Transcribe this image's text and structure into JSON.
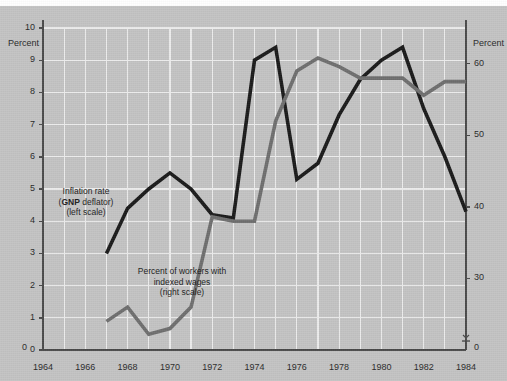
{
  "figure": {
    "background_color": "#c3c3c3",
    "plot_area": {
      "left": 43,
      "right": 466,
      "top": 28,
      "bottom": 350
    },
    "left_axis_title": "Percent",
    "right_axis_title": "Percent"
  },
  "annotations": [
    {
      "name": "inflation-label",
      "lines": [
        "Inflation rate",
        "(GNP deflator)",
        "(left scale)"
      ],
      "bold_word": "GNP",
      "x": 86,
      "y": 186
    },
    {
      "name": "indexed-wages-label",
      "lines": [
        "Percent of workers with",
        "indexed wages",
        "(right scale)"
      ],
      "x": 182,
      "y": 266
    }
  ],
  "chart_data": {
    "type": "line",
    "title": "",
    "xlabel": "",
    "ylabel": "Percent",
    "grid": true,
    "legend_position": "inline-annotations",
    "x": [
      1964,
      1965,
      1966,
      1967,
      1968,
      1969,
      1970,
      1971,
      1972,
      1973,
      1974,
      1975,
      1976,
      1977,
      1978,
      1979,
      1980,
      1981,
      1982,
      1983,
      1984
    ],
    "x_ticks": [
      1964,
      1966,
      1968,
      1970,
      1972,
      1974,
      1976,
      1978,
      1980,
      1982,
      1984
    ],
    "xlim": [
      1964,
      1984
    ],
    "left_axis": {
      "label": "Percent",
      "ticks": [
        0,
        1,
        2,
        3,
        4,
        5,
        6,
        7,
        8,
        9,
        10
      ],
      "ylim": [
        0,
        10
      ]
    },
    "right_axis": {
      "label": "Percent",
      "ticks": [
        0,
        30,
        40,
        50,
        60
      ],
      "ylim": [
        20,
        65
      ],
      "has_break": true,
      "break_marker": "axis-break-arrow"
    },
    "series": [
      {
        "name": "Inflation rate (GNP deflator)",
        "axis": "left",
        "color": "#1a1a1a",
        "width": 3.6,
        "points": [
          {
            "x": 1967,
            "y": 3.0
          },
          {
            "x": 1968,
            "y": 4.4
          },
          {
            "x": 1969,
            "y": 5.0
          },
          {
            "x": 1970,
            "y": 5.5
          },
          {
            "x": 1971,
            "y": 5.0
          },
          {
            "x": 1972,
            "y": 4.2
          },
          {
            "x": 1973,
            "y": 4.1
          },
          {
            "x": 1974,
            "y": 9.0
          },
          {
            "x": 1975,
            "y": 9.4
          },
          {
            "x": 1976,
            "y": 5.3
          },
          {
            "x": 1977,
            "y": 5.8
          },
          {
            "x": 1978,
            "y": 7.3
          },
          {
            "x": 1979,
            "y": 8.4
          },
          {
            "x": 1980,
            "y": 9.0
          },
          {
            "x": 1981,
            "y": 9.4
          },
          {
            "x": 1982,
            "y": 7.5
          },
          {
            "x": 1983,
            "y": 6.0
          },
          {
            "x": 1984,
            "y": 4.3
          }
        ]
      },
      {
        "name": "Percent of workers with indexed wages",
        "axis": "right",
        "color": "#6e6e6e",
        "width": 3.6,
        "points": [
          {
            "x": 1967,
            "y": 24.0
          },
          {
            "x": 1968,
            "y": 26.0
          },
          {
            "x": 1969,
            "y": 22.2
          },
          {
            "x": 1970,
            "y": 23.0
          },
          {
            "x": 1971,
            "y": 26.0
          },
          {
            "x": 1972,
            "y": 38.6
          },
          {
            "x": 1973,
            "y": 38.0
          },
          {
            "x": 1974,
            "y": 38.0
          },
          {
            "x": 1975,
            "y": 52.0
          },
          {
            "x": 1976,
            "y": 59.0
          },
          {
            "x": 1977,
            "y": 60.8
          },
          {
            "x": 1978,
            "y": 59.6
          },
          {
            "x": 1979,
            "y": 58.0
          },
          {
            "x": 1980,
            "y": 58.0
          },
          {
            "x": 1981,
            "y": 58.0
          },
          {
            "x": 1982,
            "y": 55.6
          },
          {
            "x": 1983,
            "y": 57.5
          },
          {
            "x": 1984,
            "y": 57.5
          }
        ]
      }
    ]
  }
}
